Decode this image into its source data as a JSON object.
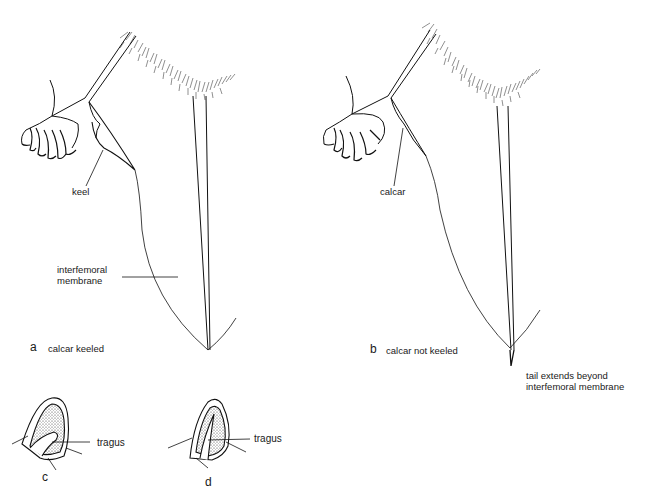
{
  "figure": {
    "panels": [
      {
        "id": "a",
        "letter": "a",
        "caption": "calcar keeled",
        "labels": {
          "structure": "keel",
          "membrane": "interfemoral\nmembrane"
        }
      },
      {
        "id": "b",
        "letter": "b",
        "caption": "calcar not keeled",
        "labels": {
          "structure": "calcar",
          "tail_note": "tail extends beyond\ninterfemoral membrane"
        }
      },
      {
        "id": "c",
        "letter": "c",
        "labels": {
          "part": "tragus"
        }
      },
      {
        "id": "d",
        "letter": "d",
        "labels": {
          "part": "tragus"
        }
      }
    ]
  }
}
